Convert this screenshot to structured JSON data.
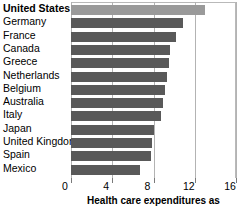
{
  "chart_data": {
    "type": "bar",
    "orientation": "horizontal",
    "title": "",
    "xlabel": "Health care expenditures as",
    "ylabel": "",
    "xlim": [
      0,
      16
    ],
    "xticks": [
      0,
      4,
      8,
      12,
      16
    ],
    "xtick_labels": [
      "0",
      "4",
      "8",
      "12",
      "16"
    ],
    "grid": true,
    "grid_axis": "x",
    "legend": false,
    "highlight_category": "United States",
    "colors": {
      "bar": "#595959",
      "bar_highlight": "#9a9a9a",
      "gridline": "#b3b3b3",
      "text": "#000000"
    },
    "categories": [
      "United States",
      "Germany",
      "France",
      "Canada",
      "Greece",
      "Netherlands",
      "Belgium",
      "Australia",
      "Italy",
      "Japan",
      "United Kingdom",
      "Spain",
      "Mexico"
    ],
    "values": [
      13.0,
      10.9,
      10.2,
      9.6,
      9.5,
      9.3,
      9.1,
      8.9,
      8.7,
      8.0,
      7.9,
      7.8,
      6.7
    ]
  },
  "caption": {
    "text": "Health care expenditures as"
  },
  "tick_labels": [
    "0",
    "4",
    "8",
    "12",
    "16"
  ]
}
